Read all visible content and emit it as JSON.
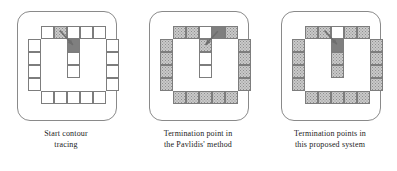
{
  "figure": {
    "background_color": "#ffffff",
    "frame_color": "#8a8a8a",
    "cell_border_color": "#7d7d7d",
    "cell_white_color": "#ffffff",
    "cell_gray_color": "#c9c9c9",
    "cell_dark_color": "#7f7f7f",
    "arrow_color": "#6e6e6e",
    "cell_size_px": 13
  },
  "panels": [
    {
      "id": "panel-start-contour-tracing",
      "caption_line1": "Start contour",
      "caption_line2": "tracing",
      "cells": [
        {
          "col": 1,
          "row": 0,
          "fill": "white"
        },
        {
          "col": 2,
          "row": 0,
          "fill": "gray"
        },
        {
          "col": 3,
          "row": 0,
          "fill": "white"
        },
        {
          "col": 4,
          "row": 0,
          "fill": "white"
        },
        {
          "col": 5,
          "row": 0,
          "fill": "white"
        },
        {
          "col": 0,
          "row": 1,
          "fill": "white"
        },
        {
          "col": 3,
          "row": 1,
          "fill": "dark"
        },
        {
          "col": 6,
          "row": 1,
          "fill": "white"
        },
        {
          "col": 0,
          "row": 2,
          "fill": "white"
        },
        {
          "col": 3,
          "row": 2,
          "fill": "white"
        },
        {
          "col": 6,
          "row": 2,
          "fill": "white"
        },
        {
          "col": 0,
          "row": 3,
          "fill": "white"
        },
        {
          "col": 3,
          "row": 3,
          "fill": "white"
        },
        {
          "col": 6,
          "row": 3,
          "fill": "white"
        },
        {
          "col": 0,
          "row": 4,
          "fill": "white"
        },
        {
          "col": 6,
          "row": 4,
          "fill": "white"
        },
        {
          "col": 1,
          "row": 5,
          "fill": "white"
        },
        {
          "col": 2,
          "row": 5,
          "fill": "white"
        },
        {
          "col": 3,
          "row": 5,
          "fill": "white"
        },
        {
          "col": 4,
          "row": 5,
          "fill": "white"
        },
        {
          "col": 5,
          "row": 5,
          "fill": "white"
        }
      ],
      "arrow": {
        "x1": 2.45,
        "y1": 0.35,
        "x2": 3.45,
        "y2": 1.45
      }
    },
    {
      "id": "panel-pavlidis-termination",
      "caption_line1": "Termination point in",
      "caption_line2": "the Pavlidis' method",
      "cells": [
        {
          "col": 1,
          "row": 0,
          "fill": "gray"
        },
        {
          "col": 2,
          "row": 0,
          "fill": "gray"
        },
        {
          "col": 3,
          "row": 0,
          "fill": "white"
        },
        {
          "col": 4,
          "row": 0,
          "fill": "dark"
        },
        {
          "col": 5,
          "row": 0,
          "fill": "gray"
        },
        {
          "col": 0,
          "row": 1,
          "fill": "gray"
        },
        {
          "col": 3,
          "row": 1,
          "fill": "gray"
        },
        {
          "col": 6,
          "row": 1,
          "fill": "gray"
        },
        {
          "col": 0,
          "row": 2,
          "fill": "gray"
        },
        {
          "col": 3,
          "row": 2,
          "fill": "white"
        },
        {
          "col": 6,
          "row": 2,
          "fill": "gray"
        },
        {
          "col": 0,
          "row": 3,
          "fill": "gray"
        },
        {
          "col": 3,
          "row": 3,
          "fill": "white"
        },
        {
          "col": 6,
          "row": 3,
          "fill": "gray"
        },
        {
          "col": 0,
          "row": 4,
          "fill": "gray"
        },
        {
          "col": 6,
          "row": 4,
          "fill": "gray"
        },
        {
          "col": 1,
          "row": 5,
          "fill": "gray"
        },
        {
          "col": 2,
          "row": 5,
          "fill": "gray"
        },
        {
          "col": 3,
          "row": 5,
          "fill": "gray"
        },
        {
          "col": 4,
          "row": 5,
          "fill": "gray"
        },
        {
          "col": 5,
          "row": 5,
          "fill": "gray"
        }
      ],
      "arrow": {
        "x1": 4.45,
        "y1": 0.4,
        "x2": 3.5,
        "y2": 1.45
      }
    },
    {
      "id": "panel-proposed-termination",
      "caption_line1": "Termination points in",
      "caption_line2": "this proposed system",
      "cells": [
        {
          "col": 1,
          "row": 0,
          "fill": "gray"
        },
        {
          "col": 2,
          "row": 0,
          "fill": "gray"
        },
        {
          "col": 3,
          "row": 0,
          "fill": "white"
        },
        {
          "col": 4,
          "row": 0,
          "fill": "gray"
        },
        {
          "col": 5,
          "row": 0,
          "fill": "gray"
        },
        {
          "col": 0,
          "row": 1,
          "fill": "gray"
        },
        {
          "col": 3,
          "row": 1,
          "fill": "dark"
        },
        {
          "col": 6,
          "row": 1,
          "fill": "gray"
        },
        {
          "col": 0,
          "row": 2,
          "fill": "gray"
        },
        {
          "col": 3,
          "row": 2,
          "fill": "gray"
        },
        {
          "col": 6,
          "row": 2,
          "fill": "gray"
        },
        {
          "col": 0,
          "row": 3,
          "fill": "gray"
        },
        {
          "col": 3,
          "row": 3,
          "fill": "gray"
        },
        {
          "col": 6,
          "row": 3,
          "fill": "gray"
        },
        {
          "col": 0,
          "row": 4,
          "fill": "gray"
        },
        {
          "col": 6,
          "row": 4,
          "fill": "gray"
        },
        {
          "col": 1,
          "row": 5,
          "fill": "gray"
        },
        {
          "col": 2,
          "row": 5,
          "fill": "gray"
        },
        {
          "col": 3,
          "row": 5,
          "fill": "gray"
        },
        {
          "col": 4,
          "row": 5,
          "fill": "gray"
        },
        {
          "col": 5,
          "row": 5,
          "fill": "gray"
        }
      ],
      "arrow": {
        "x1": 2.5,
        "y1": 0.35,
        "x2": 3.45,
        "y2": 1.4
      }
    }
  ]
}
